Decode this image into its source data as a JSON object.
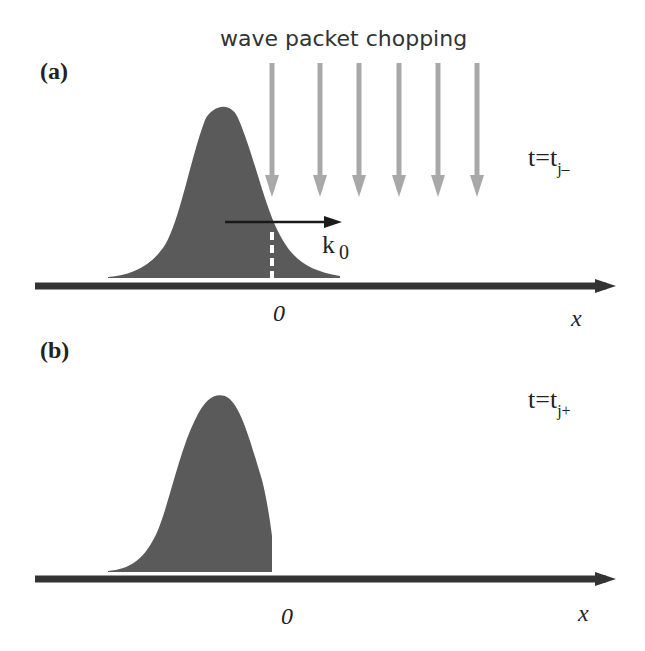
{
  "title": "wave packet chopping",
  "panels": [
    {
      "label": "(a)",
      "time_label": {
        "base": "t=t",
        "subscript": "j–"
      },
      "momentum_label": {
        "base": "k",
        "subscript": "0"
      },
      "origin_label": "0",
      "axis_label": "x",
      "state": "before chopping (full Gaussian packet)"
    },
    {
      "label": "(b)",
      "time_label": {
        "base": "t=t",
        "subscript": "j+"
      },
      "origin_label": "0",
      "axis_label": "x",
      "state": "after chopping (packet truncated at x=0)"
    }
  ],
  "colors": {
    "packet_fill": "#5a5a5a",
    "axis": "#333333",
    "chop_arrows": "#a8a8a8",
    "momentum_arrow": "#1a1a1a",
    "cut_line": "#ffffff"
  },
  "chop_arrow_count": 6
}
